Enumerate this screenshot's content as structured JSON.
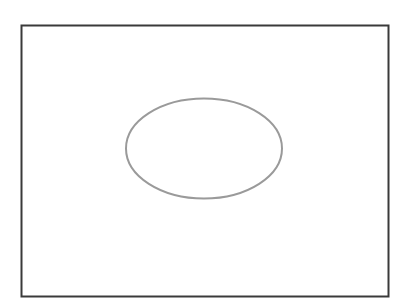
{
  "diagram": {
    "shapes": [
      {
        "kind": "rectangle",
        "name": "frame",
        "stroke": "#3a3a3a",
        "fill": "#ffffff"
      },
      {
        "kind": "ellipse",
        "name": "oval",
        "stroke": "#9a9a9a",
        "fill": "none"
      }
    ]
  }
}
